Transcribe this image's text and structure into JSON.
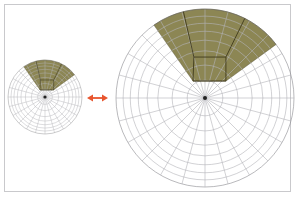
{
  "figure": {
    "colors": {
      "frame_border": "#c9c9cc",
      "grid_line": "#b4b4b8",
      "grid_line_dark": "#8a8a8e",
      "shade_fill": "#8c8654",
      "shade_stroke": "#3f3a1c",
      "arrow": "#e8552e",
      "center_dot": "#222222"
    },
    "grid": {
      "spoke_count": 24,
      "ring_fractions": [
        0.2,
        0.37,
        0.53,
        0.65,
        0.75,
        0.84,
        0.92,
        1.0
      ]
    },
    "shade": {
      "start_angle_deg": -125,
      "end_angle_deg": -37,
      "inner_polygon": [
        [
          -0.135,
          -0.19
        ],
        [
          0.235,
          -0.19
        ],
        [
          0.235,
          -0.46
        ],
        [
          -0.125,
          -0.46
        ]
      ],
      "upper_lines": [
        [
          [
            -0.125,
            -0.46
          ],
          [
            -0.25,
            -1.0
          ]
        ],
        [
          [
            0.235,
            -0.46
          ],
          [
            0.45,
            -0.9
          ]
        ]
      ]
    },
    "diagrams": [
      {
        "name": "small-polar-diagram",
        "cx": 45,
        "cy": 97,
        "r": 37
      },
      {
        "name": "large-polar-diagram",
        "cx": 205,
        "cy": 98,
        "r": 89
      }
    ],
    "arrow": {
      "x1": 87,
      "x2": 108,
      "y": 98,
      "type": "double-headed"
    }
  }
}
